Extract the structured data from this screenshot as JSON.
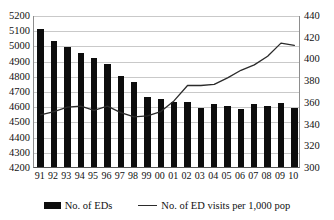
{
  "chart_data": {
    "type": "bar",
    "title": "",
    "xlabel": "",
    "categories": [
      "91",
      "92",
      "93",
      "94",
      "95",
      "96",
      "97",
      "98",
      "99",
      "00",
      "01",
      "02",
      "03",
      "04",
      "05",
      "06",
      "07",
      "08",
      "09",
      "10"
    ],
    "grid": true,
    "legend_position": "bottom",
    "axes": {
      "left": {
        "label": "No. of EDs",
        "min": 4200,
        "max": 5200,
        "step": 100,
        "ticks": [
          "4200",
          "4300",
          "4400",
          "4500",
          "4600",
          "4700",
          "4800",
          "4900",
          "5000",
          "5100",
          "5200"
        ]
      },
      "right": {
        "label": "No. of ED visits per 1,000 pop",
        "min": 300,
        "max": 440,
        "step": 20,
        "ticks": [
          "300",
          "320",
          "340",
          "360",
          "380",
          "400",
          "420",
          "440"
        ]
      }
    },
    "series": [
      {
        "name": "No. of EDs",
        "type": "bar",
        "axis": "left",
        "color": "#0d0d0d",
        "values": [
          5108,
          5030,
          4990,
          4952,
          4918,
          4878,
          4802,
          4758,
          4660,
          4648,
          4628,
          4630,
          4588,
          4612,
          4600,
          4582,
          4612,
          4600,
          4618,
          4585
        ]
      },
      {
        "name": "No. of ED visits per 1,000 pop",
        "type": "line",
        "axis": "right",
        "color": "#2b2b2b",
        "values": [
          349,
          352,
          356,
          357,
          353,
          357,
          351,
          347,
          348,
          352,
          362,
          376,
          376,
          377,
          383,
          390,
          395,
          403,
          415,
          413
        ]
      }
    ]
  },
  "legend": {
    "bar_label": "No. of EDs",
    "line_label": "No. of ED visits per 1,000 pop"
  }
}
